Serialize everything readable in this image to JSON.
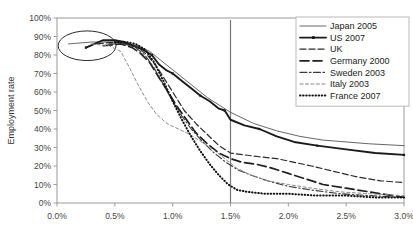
{
  "chart_data": {
    "type": "line",
    "title": "",
    "xlabel": "",
    "ylabel": "Employment rate",
    "xlim": [
      0.0,
      3.0
    ],
    "ylim": [
      0,
      100
    ],
    "grid": false,
    "legend_position": "top-right",
    "x_tick_labels": [
      "0.0%",
      "0.5%",
      "1.0%",
      "1.5%",
      "2.0%",
      "2.5%",
      "3.0%"
    ],
    "x_tick_values": [
      0.0,
      0.5,
      1.0,
      1.5,
      2.0,
      2.5,
      3.0
    ],
    "y_tick_labels": [
      "0%",
      "10%",
      "20%",
      "30%",
      "40%",
      "50%",
      "60%",
      "70%",
      "80%",
      "90%",
      "100%"
    ],
    "y_tick_values": [
      0,
      10,
      20,
      30,
      40,
      50,
      60,
      70,
      80,
      90,
      100
    ],
    "annotations": [
      {
        "name": "highlight-ellipse",
        "type": "ellipse",
        "cx": 0.26,
        "cy": 85,
        "rx": 0.25,
        "ry": 8
      },
      {
        "name": "reference-line-1.5",
        "type": "vline",
        "x": 1.5
      }
    ],
    "series": [
      {
        "name": "Japan 2005",
        "style": "solid-thin",
        "color": "#555555",
        "width": 0.9,
        "markers": false,
        "points": [
          [
            0.1,
            86
          ],
          [
            0.3,
            87
          ],
          [
            0.5,
            87
          ],
          [
            0.62,
            86
          ],
          [
            0.7,
            85
          ],
          [
            0.8,
            82
          ],
          [
            0.9,
            77
          ],
          [
            1.0,
            72
          ],
          [
            1.1,
            67
          ],
          [
            1.2,
            62
          ],
          [
            1.3,
            57
          ],
          [
            1.4,
            53
          ],
          [
            1.5,
            49
          ],
          [
            1.7,
            43
          ],
          [
            1.9,
            39
          ],
          [
            2.1,
            36
          ],
          [
            2.3,
            34
          ],
          [
            2.5,
            33
          ],
          [
            2.7,
            32
          ],
          [
            3.0,
            31
          ]
        ]
      },
      {
        "name": "US 2007",
        "style": "solid-thick",
        "color": "#1a1a1a",
        "width": 1.9,
        "markers": true,
        "points": [
          [
            0.25,
            84
          ],
          [
            0.4,
            88
          ],
          [
            0.5,
            88
          ],
          [
            0.58,
            87
          ],
          [
            0.66,
            85
          ],
          [
            0.74,
            83
          ],
          [
            0.82,
            80
          ],
          [
            0.88,
            75
          ],
          [
            0.94,
            72
          ],
          [
            1.0,
            70
          ],
          [
            1.08,
            66
          ],
          [
            1.16,
            62
          ],
          [
            1.24,
            58
          ],
          [
            1.32,
            55
          ],
          [
            1.4,
            51
          ],
          [
            1.45,
            50
          ],
          [
            1.5,
            45
          ],
          [
            1.62,
            42
          ],
          [
            1.75,
            40
          ],
          [
            1.9,
            36
          ],
          [
            2.05,
            33
          ],
          [
            2.25,
            31
          ],
          [
            2.5,
            29
          ],
          [
            2.75,
            27
          ],
          [
            3.0,
            26
          ]
        ]
      },
      {
        "name": "UK",
        "style": "dashed",
        "color": "#2a2a2a",
        "width": 1.2,
        "markers": false,
        "points": [
          [
            0.35,
            86
          ],
          [
            0.5,
            87
          ],
          [
            0.6,
            86
          ],
          [
            0.7,
            84
          ],
          [
            0.78,
            80
          ],
          [
            0.86,
            74
          ],
          [
            0.94,
            66
          ],
          [
            1.02,
            58
          ],
          [
            1.1,
            50
          ],
          [
            1.2,
            43
          ],
          [
            1.3,
            37
          ],
          [
            1.4,
            31
          ],
          [
            1.5,
            27
          ],
          [
            1.62,
            26
          ],
          [
            1.75,
            25
          ],
          [
            1.9,
            24
          ],
          [
            2.05,
            22
          ],
          [
            2.2,
            20
          ],
          [
            2.4,
            17
          ],
          [
            2.6,
            14
          ],
          [
            2.8,
            12
          ],
          [
            3.0,
            11
          ]
        ]
      },
      {
        "name": "Germany 2000",
        "style": "longdash",
        "color": "#1f1f1f",
        "width": 1.7,
        "markers": false,
        "points": [
          [
            0.4,
            85
          ],
          [
            0.55,
            86
          ],
          [
            0.65,
            84
          ],
          [
            0.72,
            81
          ],
          [
            0.8,
            76
          ],
          [
            0.88,
            68
          ],
          [
            0.96,
            60
          ],
          [
            1.04,
            52
          ],
          [
            1.12,
            45
          ],
          [
            1.2,
            38
          ],
          [
            1.3,
            32
          ],
          [
            1.4,
            27
          ],
          [
            1.5,
            24
          ],
          [
            1.6,
            22
          ],
          [
            1.72,
            21
          ],
          [
            1.85,
            19
          ],
          [
            2.0,
            16
          ],
          [
            2.15,
            13
          ],
          [
            2.3,
            10
          ],
          [
            2.5,
            8
          ],
          [
            2.7,
            6
          ],
          [
            2.9,
            4
          ],
          [
            3.0,
            3
          ]
        ]
      },
      {
        "name": "Sweden 2003",
        "style": "dashdot",
        "color": "#3a3a3a",
        "width": 1.1,
        "markers": false,
        "points": [
          [
            0.45,
            86
          ],
          [
            0.58,
            86
          ],
          [
            0.68,
            84
          ],
          [
            0.76,
            80
          ],
          [
            0.84,
            73
          ],
          [
            0.92,
            64
          ],
          [
            1.0,
            55
          ],
          [
            1.08,
            47
          ],
          [
            1.16,
            40
          ],
          [
            1.26,
            33
          ],
          [
            1.36,
            27
          ],
          [
            1.46,
            22
          ],
          [
            1.56,
            18
          ],
          [
            1.68,
            15
          ],
          [
            1.82,
            12
          ],
          [
            2.0,
            9
          ],
          [
            2.2,
            7
          ],
          [
            2.45,
            5
          ],
          [
            2.7,
            4
          ],
          [
            3.0,
            3
          ]
        ]
      },
      {
        "name": "Italy 2003",
        "style": "shortdash",
        "color": "#8a8a8a",
        "width": 1.0,
        "markers": false,
        "points": [
          [
            0.3,
            86
          ],
          [
            0.45,
            85
          ],
          [
            0.55,
            82
          ],
          [
            0.62,
            74
          ],
          [
            0.7,
            64
          ],
          [
            0.78,
            55
          ],
          [
            0.86,
            48
          ],
          [
            0.95,
            43
          ],
          [
            1.05,
            40
          ],
          [
            1.15,
            37
          ],
          [
            1.25,
            33
          ],
          [
            1.35,
            29
          ],
          [
            1.45,
            24
          ],
          [
            1.55,
            19
          ],
          [
            1.68,
            15
          ],
          [
            1.82,
            12
          ],
          [
            2.0,
            10
          ],
          [
            2.2,
            8
          ],
          [
            2.45,
            6
          ],
          [
            2.7,
            5
          ],
          [
            3.0,
            4
          ]
        ]
      },
      {
        "name": "France 2007",
        "style": "dotted",
        "color": "#111111",
        "width": 2.0,
        "markers": false,
        "points": [
          [
            0.5,
            87
          ],
          [
            0.6,
            87
          ],
          [
            0.68,
            86
          ],
          [
            0.76,
            83
          ],
          [
            0.84,
            76
          ],
          [
            0.92,
            66
          ],
          [
            1.0,
            55
          ],
          [
            1.08,
            45
          ],
          [
            1.16,
            36
          ],
          [
            1.24,
            28
          ],
          [
            1.32,
            21
          ],
          [
            1.4,
            15
          ],
          [
            1.48,
            10
          ],
          [
            1.56,
            7
          ],
          [
            1.65,
            6
          ],
          [
            1.8,
            5
          ],
          [
            2.0,
            5
          ],
          [
            2.25,
            4
          ],
          [
            2.5,
            4
          ],
          [
            2.75,
            3
          ],
          [
            3.0,
            3
          ]
        ]
      }
    ]
  },
  "legend": {
    "items": [
      {
        "label": "Japan 2005"
      },
      {
        "label": "US 2007"
      },
      {
        "label": "UK"
      },
      {
        "label": "Germany 2000"
      },
      {
        "label": "Sweden 2003"
      },
      {
        "label": "Italy 2003"
      },
      {
        "label": "France 2007"
      }
    ]
  }
}
